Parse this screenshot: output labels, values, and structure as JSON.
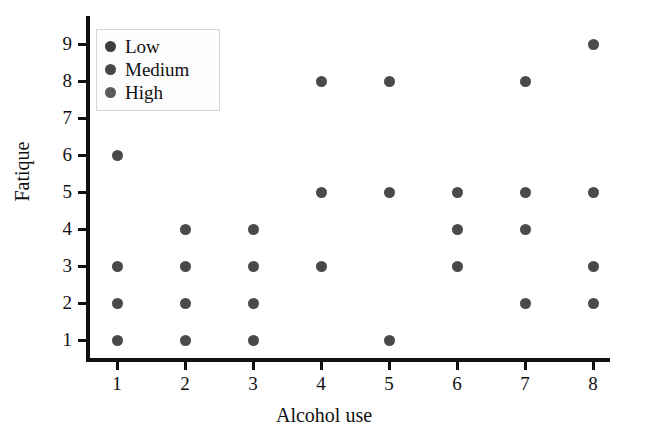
{
  "chart_data": {
    "type": "scatter",
    "title": "",
    "xlabel": "Alcohol use",
    "ylabel": "Fatique",
    "xlim": [
      0.5,
      8.6
    ],
    "ylim": [
      0.4,
      9.5
    ],
    "xticks": [
      "1",
      "2",
      "3",
      "4",
      "5",
      "6",
      "7",
      "8"
    ],
    "yticks": [
      "1",
      "2",
      "3",
      "4",
      "5",
      "6",
      "7",
      "8",
      "9"
    ],
    "grid": false,
    "legend_position": "top-left",
    "marker_color": "#4a4a4a",
    "axis_color": "#111111",
    "legend": [
      {
        "label": "Low",
        "color": "#3f3f3f"
      },
      {
        "label": "Medium",
        "color": "#474747"
      },
      {
        "label": "High",
        "color": "#5a5a5a"
      }
    ],
    "points": [
      {
        "x": 1,
        "y": 6
      },
      {
        "x": 1,
        "y": 3
      },
      {
        "x": 1,
        "y": 2
      },
      {
        "x": 1,
        "y": 1
      },
      {
        "x": 2,
        "y": 4
      },
      {
        "x": 2,
        "y": 3
      },
      {
        "x": 2,
        "y": 2
      },
      {
        "x": 2,
        "y": 1
      },
      {
        "x": 3,
        "y": 4
      },
      {
        "x": 3,
        "y": 3
      },
      {
        "x": 3,
        "y": 2
      },
      {
        "x": 3,
        "y": 1
      },
      {
        "x": 4,
        "y": 8
      },
      {
        "x": 4,
        "y": 5
      },
      {
        "x": 4,
        "y": 3
      },
      {
        "x": 5,
        "y": 8
      },
      {
        "x": 5,
        "y": 5
      },
      {
        "x": 5,
        "y": 1
      },
      {
        "x": 6,
        "y": 5
      },
      {
        "x": 6,
        "y": 4
      },
      {
        "x": 6,
        "y": 3
      },
      {
        "x": 7,
        "y": 8
      },
      {
        "x": 7,
        "y": 5
      },
      {
        "x": 7,
        "y": 4
      },
      {
        "x": 7,
        "y": 2
      },
      {
        "x": 8,
        "y": 9
      },
      {
        "x": 8,
        "y": 5
      },
      {
        "x": 8,
        "y": 3
      },
      {
        "x": 8,
        "y": 2
      }
    ]
  }
}
